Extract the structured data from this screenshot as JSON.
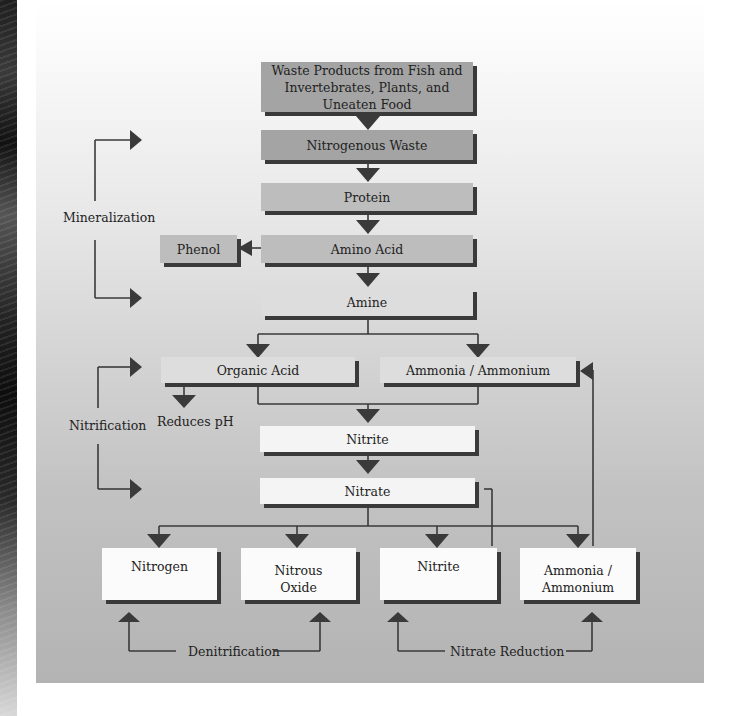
{
  "diagram": {
    "colors": {
      "line": "#3a3a3a",
      "box_dark": "#a4a4a4",
      "box_mid": "#bdbdbd",
      "box_light": "#dddddd",
      "box_white": "#f4f4f4"
    },
    "nodes": {
      "waste_products": "Waste Products from Fish and Invertebrates, Plants, and Uneaten Food",
      "waste_products_line1": "Waste Products from Fish and",
      "waste_products_line2": "Invertebrates, Plants, and Uneaten Food",
      "nitrogenous_waste": "Nitrogenous Waste",
      "protein": "Protein",
      "amino_acid": "Amino Acid",
      "phenol": "Phenol",
      "amine": "Amine",
      "organic_acid": "Organic Acid",
      "ammonia_ammonium": "Ammonia / Ammonium",
      "reduces_ph": "Reduces pH",
      "nitrite": "Nitrite",
      "nitrate": "Nitrate",
      "nitrogen": "Nitrogen",
      "nitrous_oxide_line1": "Nitrous",
      "nitrous_oxide_line2": "Oxide",
      "nitrite_bottom": "Nitrite",
      "ammonia_bottom_line1": "Ammonia /",
      "ammonia_bottom_line2": "Ammonium"
    },
    "processes": {
      "mineralization": "Mineralization",
      "nitrification": "Nitrification",
      "denitrification": "Denitrification",
      "nitrate_reduction": "Nitrate Reduction"
    }
  }
}
